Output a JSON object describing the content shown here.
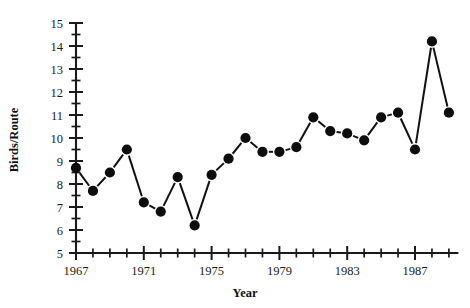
{
  "chart_data": {
    "type": "line",
    "title": "",
    "subtitle": "",
    "xlabel": "Year",
    "ylabel": "Birds/Route",
    "xlim": [
      1966.5,
      1989.5
    ],
    "ylim": [
      5,
      15
    ],
    "grid": false,
    "legend": null,
    "marker": "filled-circle",
    "line_style": "solid-segments",
    "y_ticks_major": [
      5,
      6,
      7,
      8,
      9,
      10,
      11,
      12,
      13,
      14,
      15
    ],
    "y_ticks_minor": [
      5.5,
      6.5,
      7.5,
      8.5,
      9.5,
      10.5,
      11.5,
      12.5,
      13.5,
      14.5
    ],
    "y_tick_labels": [
      "5",
      "6",
      "7",
      "8",
      "9",
      "10",
      "11",
      "12",
      "13",
      "14",
      "15"
    ],
    "x_ticks_major": [
      1967,
      1971,
      1975,
      1979,
      1983,
      1987
    ],
    "x_tick_labels": [
      "1967",
      "1971",
      "1975",
      "1979",
      "1983",
      "1987"
    ],
    "x_ticks_minor": [
      1968,
      1969,
      1970,
      1972,
      1973,
      1974,
      1976,
      1977,
      1978,
      1980,
      1981,
      1982,
      1984,
      1985,
      1986,
      1988,
      1989
    ],
    "x": [
      1967,
      1968,
      1969,
      1970,
      1971,
      1972,
      1973,
      1974,
      1975,
      1976,
      1977,
      1978,
      1979,
      1980,
      1981,
      1982,
      1983,
      1984,
      1985,
      1986,
      1987,
      1988,
      1989
    ],
    "values": [
      8.7,
      7.7,
      8.5,
      9.5,
      7.2,
      6.8,
      8.3,
      6.2,
      8.4,
      9.1,
      10.0,
      9.4,
      9.4,
      9.6,
      10.9,
      10.3,
      10.2,
      9.9,
      10.9,
      11.1,
      9.5,
      14.2,
      11.1
    ],
    "series": [
      {
        "name": "Birds per Route",
        "values": [
          8.7,
          7.7,
          8.5,
          9.5,
          7.2,
          6.8,
          8.3,
          6.2,
          8.4,
          9.1,
          10.0,
          9.4,
          9.4,
          9.6,
          10.9,
          10.3,
          10.2,
          9.9,
          10.9,
          11.1,
          9.5,
          14.2,
          11.1
        ]
      }
    ],
    "colors": {
      "line": "#111111",
      "marker": "#0d0d0d",
      "axis": "#1a1a1a",
      "background": "#ffffff"
    }
  }
}
